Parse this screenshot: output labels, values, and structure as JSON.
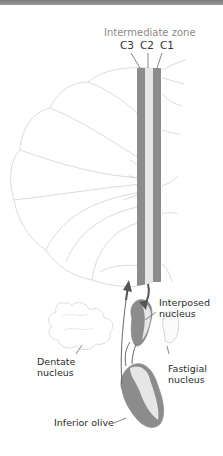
{
  "figure": {
    "title_label": "Intermediate zone",
    "zone_labels": [
      "C3",
      "C2",
      "C1"
    ],
    "structures": {
      "interposed_line1": "Interposed",
      "interposed_line2": "nucleus",
      "dentate_line1": "Dentate",
      "dentate_line2": "nucleus",
      "fastigial_line1": "Fastigial",
      "fastigial_line2": "nucleus",
      "inferior_olive": "Inferior olive"
    },
    "colors": {
      "dark_strip": "#8c8c8c",
      "light_strip": "#e6e6e6",
      "outline": "#d8d8d8",
      "arrow": "#555555",
      "top_bar": "#8a8a8a"
    }
  }
}
